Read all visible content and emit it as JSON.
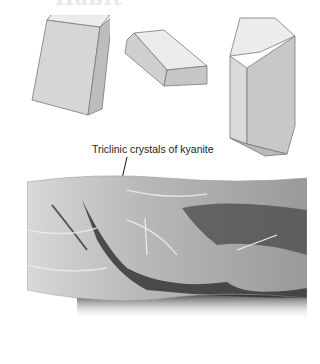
{
  "page": {
    "heading": "Habit",
    "caption": "Triclinic crystals of kyanite"
  },
  "figures": [
    {
      "name": "bladed-crystal",
      "description": "tilted bladed triclinic crystal"
    },
    {
      "name": "tabular-crystal",
      "description": "flat tabular crystal with bevelled edges"
    },
    {
      "name": "prismatic-crystal",
      "description": "elongated prismatic crystal with terminations"
    }
  ],
  "photo": {
    "subject": "Specimen of kyanite in rock matrix"
  },
  "colors": {
    "face_light": "#e9e9e9",
    "face_mid": "#d2d2d2",
    "face_dark": "#b8b8b8",
    "edge": "#7a7a7a",
    "text": "#222222"
  }
}
